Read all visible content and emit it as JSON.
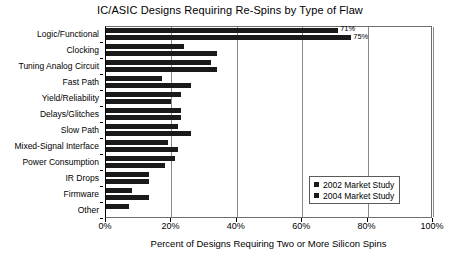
{
  "chart_data": {
    "type": "bar",
    "orientation": "horizontal",
    "title": "IC/ASIC Designs Requiring Re-Spins by Type of Flaw",
    "xlabel": "Percent of Designs Requiring Two or More Silicon Spins",
    "ylabel": "",
    "xlim": [
      0,
      100
    ],
    "xticks": [
      0,
      20,
      40,
      60,
      80,
      100
    ],
    "xtick_labels": [
      "0%",
      "20%",
      "40%",
      "60%",
      "80%",
      "100%"
    ],
    "grid": true,
    "grid_axis": "x",
    "legend_position": "lower-right",
    "categories": [
      "Logic/Functional",
      "Clocking",
      "Tuning Analog Circuit",
      "Fast Path",
      "Yield/Reliability",
      "Delays/Glitches",
      "Slow Path",
      "Mixed-Signal Interface",
      "Power Consumption",
      "IR Drops",
      "Firmware",
      "Other"
    ],
    "series": [
      {
        "name": "2002 Market Study",
        "color": "#1a1a1a",
        "values": [
          71,
          24,
          32,
          17,
          23,
          23,
          22,
          19,
          21,
          13,
          8,
          7
        ]
      },
      {
        "name": "2004 Market Study",
        "color": "#1a1a1a",
        "values": [
          75,
          34,
          34,
          26,
          20,
          23,
          26,
          22,
          18,
          13,
          13,
          0
        ]
      }
    ],
    "annotations": [
      {
        "series": "2002 Market Study",
        "category": "Logic/Functional",
        "text": "71%"
      },
      {
        "series": "2004 Market Study",
        "category": "Logic/Functional",
        "text": "75%"
      }
    ]
  },
  "legend": {
    "items": [
      {
        "label": "2002 Market Study",
        "color": "#1a1a1a"
      },
      {
        "label": "2004 Market Study",
        "color": "#1a1a1a"
      }
    ]
  }
}
